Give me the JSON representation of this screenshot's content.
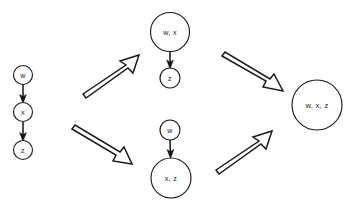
{
  "figure": {
    "background_color": "#ffffff",
    "stroke_color": "#1a1a1a",
    "width": 358,
    "height": 206
  },
  "stages": [
    {
      "id": "stage-1",
      "name": "initial-chain",
      "nodes": [
        {
          "id": "n1",
          "label": "w",
          "cx": 23,
          "cy": 75,
          "r": 9.5,
          "size": "sm"
        },
        {
          "id": "n2",
          "label": "x",
          "cx": 23,
          "cy": 112,
          "r": 9.5,
          "size": "sm"
        },
        {
          "id": "n3",
          "label": "z",
          "cx": 23,
          "cy": 150,
          "r": 9.5,
          "size": "sm"
        }
      ],
      "edges": [
        {
          "from": "n1",
          "to": "n2",
          "x1": 23,
          "y1": 84.5,
          "x2": 23,
          "y2": 102.5
        },
        {
          "from": "n2",
          "to": "n3",
          "x1": 23,
          "y1": 121.5,
          "x2": 23,
          "y2": 140.5
        }
      ]
    },
    {
      "id": "stage-2a",
      "name": "merged-wx-top",
      "nodes": [
        {
          "id": "n4",
          "label": "w, x",
          "cx": 170,
          "cy": 32,
          "r": 19.5,
          "size": "md"
        },
        {
          "id": "n5",
          "label": "z",
          "cx": 170,
          "cy": 78,
          "r": 10,
          "size": "sm"
        }
      ],
      "edges": [
        {
          "from": "n4",
          "to": "n5",
          "x1": 170,
          "y1": 51.5,
          "x2": 170,
          "y2": 68
        }
      ]
    },
    {
      "id": "stage-2b",
      "name": "merged-xz-bottom",
      "nodes": [
        {
          "id": "n6",
          "label": "w",
          "cx": 170,
          "cy": 130,
          "r": 10,
          "size": "sm"
        },
        {
          "id": "n7",
          "label": "x, z",
          "cx": 171,
          "cy": 178,
          "r": 20,
          "size": "md"
        }
      ],
      "edges": [
        {
          "from": "n6",
          "to": "n7",
          "x1": 170,
          "y1": 140,
          "x2": 170.5,
          "y2": 158
        }
      ]
    },
    {
      "id": "stage-3",
      "name": "fully-merged",
      "nodes": [
        {
          "id": "n8",
          "label": "w, x, z",
          "cx": 317,
          "cy": 105,
          "r": 25,
          "size": "lg"
        }
      ],
      "edges": []
    }
  ],
  "transitions": [
    {
      "id": "t1",
      "name": "chain-to-wx",
      "direction": "up-right",
      "from_stage": "stage-1",
      "to_stage": "stage-2a",
      "outline": "M 83,94 L 126,65 L 120,61 L 139,55 L 133,73 L 128,68 L 86,98 Z"
    },
    {
      "id": "t2",
      "name": "chain-to-xz",
      "direction": "down-right",
      "from_stage": "stage-1",
      "to_stage": "stage-2b",
      "outline": "M 72,129 L 116,155 L 113,161 L 132,164 L 124,147 L 120,152 L 75,125 Z"
    },
    {
      "id": "t3",
      "name": "wx-to-final",
      "direction": "down-right",
      "from_stage": "stage-2a",
      "to_stage": "stage-3",
      "outline": "M 222,56 L 266,81 L 263,87 L 283,91 L 274,74 L 270,79 L 225,52 Z"
    },
    {
      "id": "t4",
      "name": "xz-to-final",
      "direction": "up-right",
      "from_stage": "stage-2b",
      "to_stage": "stage-3",
      "outline": "M 216,170 L 259,141 L 253,137 L 272,131 L 266,149 L 261,144 L 219,174 Z"
    }
  ]
}
